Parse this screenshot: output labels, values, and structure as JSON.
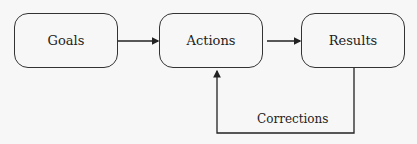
{
  "diagram": {
    "nodes": [
      {
        "id": "goals",
        "label": "Goals"
      },
      {
        "id": "actions",
        "label": "Actions"
      },
      {
        "id": "results",
        "label": "Results"
      }
    ],
    "edges": [
      {
        "from": "goals",
        "to": "actions",
        "label": ""
      },
      {
        "from": "actions",
        "to": "results",
        "label": ""
      },
      {
        "from": "results",
        "to": "actions",
        "label": "Corrections"
      }
    ]
  }
}
